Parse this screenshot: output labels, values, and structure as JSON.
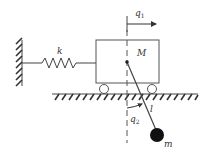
{
  "diagram": {
    "labels": {
      "spring": "k",
      "cart_mass": "M",
      "cart_displacement": "q",
      "cart_displacement_sub": "1",
      "pendulum_angle": "q",
      "pendulum_angle_sub": "2",
      "pendulum_length": "l",
      "pendulum_mass": "m"
    },
    "colors": {
      "stroke": "#444444",
      "bob": "#111111",
      "background": "#ffffff"
    }
  }
}
